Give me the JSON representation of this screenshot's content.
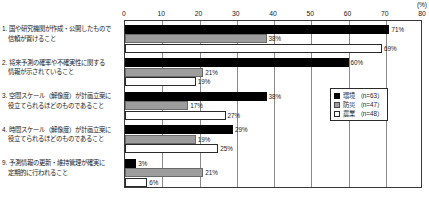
{
  "chart_data": {
    "type": "bar",
    "orientation": "horizontal",
    "title": "",
    "xlabel": "(%)",
    "ylabel": "",
    "xlim": [
      0,
      80
    ],
    "xticks": [
      0,
      10,
      20,
      30,
      40,
      50,
      60,
      70,
      80
    ],
    "grid": true,
    "legend_position": "center-right",
    "unit_label": "(%)",
    "categories": [
      "1. 国や研究機関が作成・公開したもので信頼が置けること",
      "2. 将来予測の確率や不確実性に関する情報が示されていること",
      "3. 空間スケール（解像度）が計画立案に役立てられるほどのものであること",
      "4. 時間スケール（解像度）が計画立案に役立てられるほどのものであること",
      "9. 予測情報の更新・維持管理が確実に定期的に行われること"
    ],
    "category_lines": [
      [
        "1. 国や研究機関が作成・公開したもので",
        "信頼が置けること"
      ],
      [
        "2. 将来予測の確率や不確実性に関する",
        "情報が示されていること"
      ],
      [
        "3. 空間スケール（解像度）が計画立案に",
        "役立てられるほどのものであること"
      ],
      [
        "4. 時間スケール（解像度）が計画立案に",
        "役立てられるほどのものであること"
      ],
      [
        "9. 予測情報の更新・維持管理が確実に",
        "定期的に行われること"
      ]
    ],
    "series": [
      {
        "name": "環境",
        "sample_size": "n=63",
        "legend_label": "環境 （n=63）",
        "color": "#000000",
        "values": [
          71,
          60,
          38,
          29,
          3
        ],
        "value_labels": [
          "71%",
          "60%",
          "38%",
          "29%",
          "3%"
        ]
      },
      {
        "name": "防災",
        "sample_size": "n=47",
        "legend_label": "防災 （n=47）",
        "color": "#9d9d9d",
        "values": [
          38,
          21,
          17,
          19,
          21
        ],
        "value_labels": [
          "38%",
          "21%",
          "17%",
          "19%",
          "21%"
        ]
      },
      {
        "name": "農業",
        "sample_size": "n=48",
        "legend_label": "農業 （n=48）",
        "color": "#ffffff",
        "values": [
          69,
          19,
          27,
          25,
          6
        ],
        "value_labels": [
          "69%",
          "19%",
          "27%",
          "25%",
          "6%"
        ]
      }
    ]
  }
}
